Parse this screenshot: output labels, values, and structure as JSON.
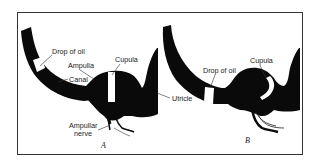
{
  "figure": {
    "frame_color": "#333333",
    "fill_color": "#0a0a0a",
    "background": "#ffffff",
    "panels": [
      {
        "id": "A",
        "letter": "A",
        "labels": {
          "drop_of_oil": "Drop of oil",
          "ampulla": "Ampulla",
          "canal": "Canal",
          "cupula": "Cupula",
          "ampullar_nerve_line1": "Ampullar",
          "ampullar_nerve_line2": "nerve"
        }
      },
      {
        "id": "B",
        "letter": "B",
        "labels": {
          "drop_of_oil": "Drop of oil",
          "cupula": "Cupula"
        }
      }
    ],
    "shared_labels": {
      "utricle": "Utricle"
    }
  }
}
